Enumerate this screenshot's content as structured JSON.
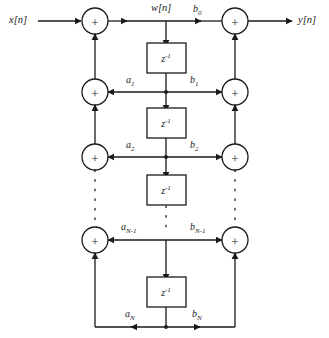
{
  "diagram": {
    "stroke_color": "#1a1a1a",
    "background": "#ffffff",
    "signals": {
      "input": "x[n]",
      "intermediate": "w[n]",
      "output": "y[n]"
    },
    "summer_symbol": "+",
    "delay_label": "z",
    "delay_exponent": "-1",
    "feedback_coefficients": [
      {
        "name": "a1",
        "base": "a",
        "sub": "1"
      },
      {
        "name": "a2",
        "base": "a",
        "sub": "2"
      },
      {
        "name": "aN-1",
        "base": "a",
        "sub": "N-1"
      },
      {
        "name": "aN",
        "base": "a",
        "sub": "N"
      }
    ],
    "feedforward_coefficients": [
      {
        "name": "b0",
        "base": "b",
        "sub": "0"
      },
      {
        "name": "b1",
        "base": "b",
        "sub": "1"
      },
      {
        "name": "b2",
        "base": "b",
        "sub": "2"
      },
      {
        "name": "bN-1",
        "base": "b",
        "sub": "N-1"
      },
      {
        "name": "bN",
        "base": "b",
        "sub": "N"
      }
    ],
    "delay_blocks": 4,
    "summers_left": 4,
    "summers_right": 4,
    "ellipsis_glyph": "·"
  }
}
